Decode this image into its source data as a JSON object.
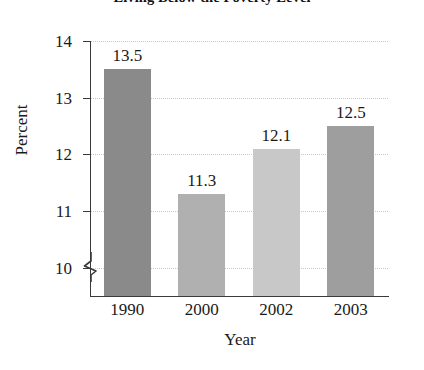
{
  "chart_data": {
    "type": "bar",
    "title": "Living Below the Poverty Level",
    "xlabel": "Year",
    "ylabel": "Percent",
    "categories": [
      "1990",
      "2000",
      "2002",
      "2003"
    ],
    "values": [
      13.5,
      11.3,
      12.1,
      12.5
    ],
    "value_labels": [
      "13.5",
      "11.3",
      "12.1",
      "12.5"
    ],
    "ylim": [
      9.5,
      14
    ],
    "yticks": [
      14,
      13,
      12,
      11,
      10
    ],
    "ytick_labels": [
      "14",
      "13",
      "12",
      "11",
      "10"
    ],
    "grid": true,
    "grid_axis": "y",
    "legend": false,
    "axis_break": true,
    "axis_break_axis": "y",
    "bar_colors": [
      "#8a8a8a",
      "#b0b0b0",
      "#c8c8c8",
      "#9e9e9e"
    ]
  }
}
